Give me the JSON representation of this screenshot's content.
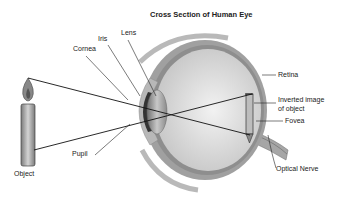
{
  "title": "Cross Section of Human Eye",
  "labels": {
    "lens": "Lens",
    "iris": "Iris",
    "cornea": "Cornea",
    "retina": "Retina",
    "inverted_image_line1": "Inverted image",
    "inverted_image_line2": "of object",
    "fovea": "Fovea",
    "pupil": "Pupil",
    "optical_nerve": "Optical Nerve",
    "object": "Object"
  },
  "colors": {
    "line": "#222222",
    "eye_outer": "#9a9a9a",
    "eye_inner": "#d8d8d8",
    "retina": "#8c8c8c",
    "candle": "#8a8a8a"
  }
}
